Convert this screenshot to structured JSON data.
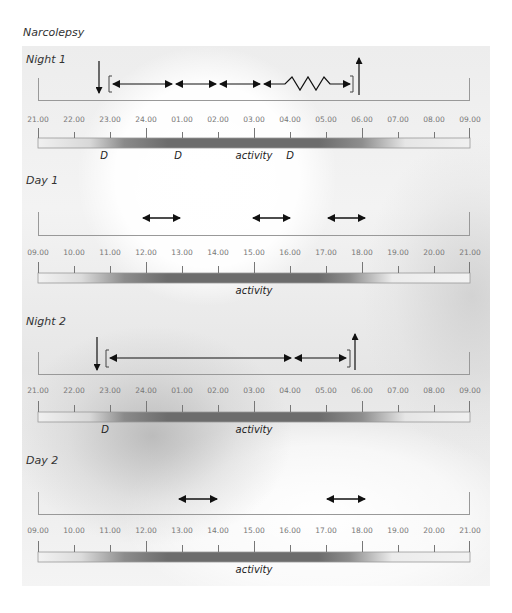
{
  "title": "Narcolepsy",
  "colors": {
    "arrow": "#111111",
    "axis": "#888888",
    "tick_label": "#777777",
    "activity_dark": "#6a6a6a",
    "activity_light": "#f0f0f0"
  },
  "panels": [
    {
      "label": "Night 1",
      "ticks": [
        "21.00",
        "22.00",
        "23.00",
        "24.00",
        "01.00",
        "02.00",
        "03.00",
        "04.00",
        "05.00",
        "06.00",
        "07.00",
        "08.00",
        "09.00"
      ],
      "markers": [
        {
          "type": "down-arrow",
          "time": "22.45",
          "meaning": "lights off / into bed"
        },
        {
          "type": "bracket-open",
          "time": "23.00"
        },
        {
          "type": "double-arrow",
          "from": "23.00",
          "to": "00.45"
        },
        {
          "type": "double-arrow",
          "from": "00.50",
          "to": "02.00"
        },
        {
          "type": "double-arrow",
          "from": "02.05",
          "to": "03.10"
        },
        {
          "type": "zigzag-arrow",
          "from": "03.15",
          "to": "05.40"
        },
        {
          "type": "bracket-close",
          "time": "05.45"
        },
        {
          "type": "up-arrow",
          "time": "05.55",
          "meaning": "get up"
        }
      ],
      "labels": [
        {
          "text": "D",
          "time": "22.45"
        },
        {
          "text": "D",
          "time": "00.45"
        },
        {
          "text": "activity",
          "time": "02.45"
        },
        {
          "text": "D",
          "time": "03.45"
        }
      ]
    },
    {
      "label": "Day 1",
      "ticks": [
        "09.00",
        "10.00",
        "11.00",
        "12.00",
        "13.00",
        "14.00",
        "15.00",
        "16.00",
        "17.00",
        "18.00",
        "19.00",
        "20.00",
        "21.00"
      ],
      "markers": [
        {
          "type": "double-arrow",
          "from": "12.00",
          "to": "13.00"
        },
        {
          "type": "double-arrow",
          "from": "15.00",
          "to": "16.00"
        },
        {
          "type": "double-arrow",
          "from": "17.00",
          "to": "18.00"
        }
      ],
      "labels": [
        {
          "text": "activity",
          "time": "15.00"
        }
      ]
    },
    {
      "label": "Night 2",
      "ticks": [
        "21.00",
        "22.00",
        "23.00",
        "24.00",
        "01.00",
        "02.00",
        "03.00",
        "04.00",
        "05.00",
        "06.00",
        "07.00",
        "08.00",
        "09.00"
      ],
      "markers": [
        {
          "type": "down-arrow",
          "time": "22.45"
        },
        {
          "type": "bracket-open",
          "time": "23.00"
        },
        {
          "type": "double-arrow",
          "from": "23.00",
          "to": "04.00"
        },
        {
          "type": "double-arrow",
          "from": "04.00",
          "to": "05.30"
        },
        {
          "type": "bracket-close",
          "time": "05.35"
        },
        {
          "type": "up-arrow",
          "time": "05.45"
        }
      ],
      "labels": [
        {
          "text": "D",
          "time": "22.45"
        },
        {
          "text": "activity",
          "time": "02.45"
        }
      ]
    },
    {
      "label": "Day 2",
      "ticks": [
        "09.00",
        "10.00",
        "11.00",
        "12.00",
        "13.00",
        "14.00",
        "15.00",
        "16.00",
        "17.00",
        "18.00",
        "19.00",
        "20.00",
        "21.00"
      ],
      "markers": [
        {
          "type": "double-arrow",
          "from": "13.00",
          "to": "14.00"
        },
        {
          "type": "double-arrow",
          "from": "17.00",
          "to": "18.00"
        }
      ],
      "labels": [
        {
          "text": "activity",
          "time": "15.00"
        }
      ]
    }
  ]
}
